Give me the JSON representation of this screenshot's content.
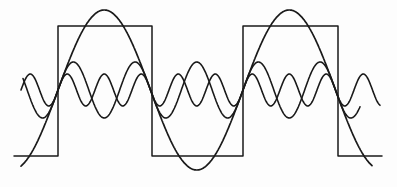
{
  "diagram": {
    "title": "",
    "colors": {
      "background": "#fdfdfd",
      "stroke": "#1a1a1a"
    },
    "axis_y": 90,
    "period_px": 185,
    "phase_x0": 58,
    "square_wave": {
      "top_y": 26,
      "bottom_y": 156,
      "path": [
        [
          14,
          156
        ],
        [
          58,
          156
        ],
        [
          58,
          26
        ],
        [
          152,
          26
        ],
        [
          152,
          156
        ],
        [
          243,
          156
        ],
        [
          243,
          26
        ],
        [
          338,
          26
        ],
        [
          338,
          156
        ],
        [
          382,
          156
        ]
      ]
    },
    "harmonics": [
      {
        "name": "fundamental",
        "order": 1,
        "amplitude_px": 80,
        "x_start": 21,
        "x_end": 372,
        "stroke_width": 1.7
      },
      {
        "name": "third-harmonic",
        "order": 3,
        "amplitude_px": 28,
        "x_start": 23,
        "x_end": 360,
        "stroke_width": 1.6
      },
      {
        "name": "fifth-harmonic",
        "order": 5,
        "amplitude_px": 16,
        "x_start": 21,
        "x_end": 380,
        "stroke_width": 1.6
      }
    ]
  }
}
